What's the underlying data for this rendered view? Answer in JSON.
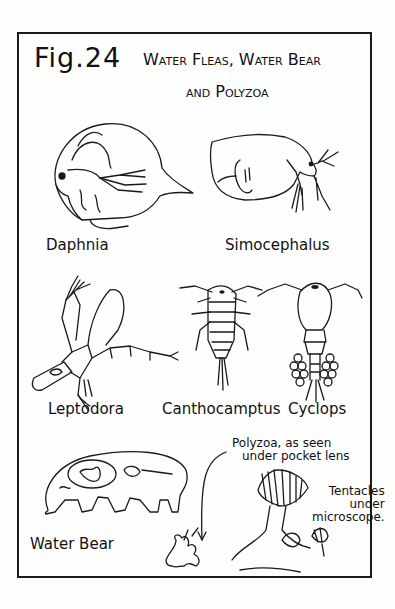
{
  "figure": {
    "number_prefix": "Fig.",
    "number": "24",
    "title_line1": "Water Fleas, Water Bear",
    "title_line2": "and Polyzoa"
  },
  "specimens": [
    {
      "id": "daphnia",
      "label": "Daphnia"
    },
    {
      "id": "simocephalus",
      "label": "Simocephalus"
    },
    {
      "id": "leptodora",
      "label": "Leptodora"
    },
    {
      "id": "canthocamptus",
      "label": "Canthocamptus"
    },
    {
      "id": "cyclops",
      "label": "Cyclops"
    },
    {
      "id": "water-bear",
      "label": "Water Bear"
    }
  ],
  "annotations": {
    "polyzoa_line1": "Polyzoa, as seen",
    "polyzoa_line2": "under pocket lens",
    "tentacles_line1": "Tentacles",
    "tentacles_line2": "under",
    "tentacles_line3": "microscope."
  },
  "colors": {
    "ink": "#1a1a1a",
    "paper": "#fdfdfb"
  }
}
